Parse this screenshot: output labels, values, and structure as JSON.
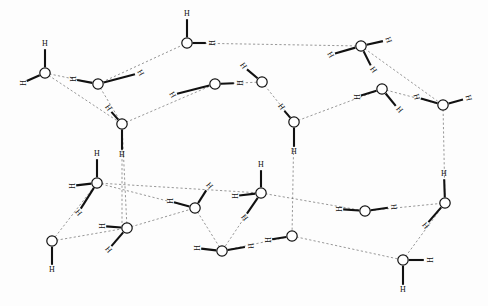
{
  "figure": {
    "title": "Hydrogen-bonded water lattice (ice structure)",
    "type": "molecular-structure-diagram",
    "background_color": "#ffffff",
    "oxygen_fill": "#ffffff",
    "oxygen_stroke": "#111111",
    "covalent_bond_color": "#111111",
    "hydrogen_bond_color": "#6b6b6b",
    "hydrogen_label": "H",
    "oxygen_radius": 5.2,
    "width": 488,
    "height": 306
  },
  "oxygens": [
    {
      "id": "o1",
      "name": "oxygen-upper-left",
      "x": 45,
      "y": 73
    },
    {
      "id": "o2",
      "name": "oxygen-upper-left-inner",
      "x": 98,
      "y": 84
    },
    {
      "id": "o3",
      "name": "oxygen-top-center",
      "x": 187,
      "y": 43
    },
    {
      "id": "o4",
      "name": "oxygen-mid-top-left",
      "x": 215,
      "y": 84
    },
    {
      "id": "o5",
      "name": "oxygen-mid-top-right",
      "x": 262,
      "y": 82
    },
    {
      "id": "o6",
      "name": "oxygen-top-right",
      "x": 361,
      "y": 46
    },
    {
      "id": "o7",
      "name": "oxygen-right-upper",
      "x": 382,
      "y": 89
    },
    {
      "id": "o8",
      "name": "oxygen-far-right-upper",
      "x": 443,
      "y": 105
    },
    {
      "id": "o9",
      "name": "oxygen-center-left-upper",
      "x": 122,
      "y": 124
    },
    {
      "id": "o10",
      "name": "oxygen-center-right-upper",
      "x": 294,
      "y": 122
    },
    {
      "id": "o11",
      "name": "oxygen-left-middle",
      "x": 97,
      "y": 183
    },
    {
      "id": "o12",
      "name": "oxygen-center-middle",
      "x": 261,
      "y": 193
    },
    {
      "id": "o13",
      "name": "oxygen-inner-lower-left",
      "x": 195,
      "y": 208
    },
    {
      "id": "o14",
      "name": "oxygen-right-middle",
      "x": 445,
      "y": 203
    },
    {
      "id": "o15",
      "name": "oxygen-lower-right-inner",
      "x": 365,
      "y": 211
    },
    {
      "id": "o16",
      "name": "oxygen-bottom-left",
      "x": 52,
      "y": 241
    },
    {
      "id": "o17",
      "name": "oxygen-bottom-left-inner",
      "x": 127,
      "y": 228
    },
    {
      "id": "o18",
      "name": "oxygen-bottom-center-left",
      "x": 222,
      "y": 251
    },
    {
      "id": "o19",
      "name": "oxygen-bottom-center-right",
      "x": 292,
      "y": 236
    },
    {
      "id": "o20",
      "name": "oxygen-bottom-right",
      "x": 403,
      "y": 260
    }
  ],
  "hydrogens": [
    {
      "id": "h1",
      "name": "hydrogen-o1-top",
      "x": 45,
      "y": 44,
      "rot": 0,
      "ox": 45,
      "oy": 73,
      "bond": "covalent"
    },
    {
      "id": "h2",
      "name": "hydrogen-o1-left",
      "x": 22,
      "y": 83,
      "rot": 90,
      "ox": 45,
      "oy": 73,
      "bond": "covalent"
    },
    {
      "id": "h3",
      "name": "hydrogen-o2-left",
      "x": 72,
      "y": 79,
      "rot": 90,
      "ox": 98,
      "oy": 84,
      "bond": "covalent"
    },
    {
      "id": "h4",
      "name": "hydrogen-o2-right",
      "x": 140,
      "y": 73,
      "rot": 60,
      "ox": 98,
      "oy": 84,
      "bond": "hydrogen"
    },
    {
      "id": "h5",
      "name": "hydrogen-o3-top",
      "x": 187,
      "y": 14,
      "rot": 0,
      "ox": 187,
      "oy": 43,
      "bond": "covalent"
    },
    {
      "id": "h6",
      "name": "hydrogen-o3-right",
      "x": 211,
      "y": 43,
      "rot": 90,
      "ox": 187,
      "oy": 43,
      "bond": "covalent"
    },
    {
      "id": "h7",
      "name": "hydrogen-o3-lower",
      "x": 243,
      "y": 66,
      "rot": 55,
      "ox": 262,
      "oy": 82,
      "bond": "covalent"
    },
    {
      "id": "h8",
      "name": "hydrogen-o4-o5",
      "x": 239,
      "y": 83,
      "rot": 90,
      "ox": 215,
      "oy": 84,
      "bond": "covalent"
    },
    {
      "id": "h9",
      "name": "hydrogen-o4-left",
      "x": 172,
      "y": 95,
      "rot": 60,
      "ox": 215,
      "oy": 84,
      "bond": "hydrogen"
    },
    {
      "id": "h10",
      "name": "hydrogen-o5-lower",
      "x": 281,
      "y": 107,
      "rot": 55,
      "ox": 294,
      "oy": 122,
      "bond": "covalent"
    },
    {
      "id": "h11",
      "name": "hydrogen-o6-right",
      "x": 388,
      "y": 40,
      "rot": 70,
      "ox": 361,
      "oy": 46,
      "bond": "covalent"
    },
    {
      "id": "h12",
      "name": "hydrogen-o6-left",
      "x": 330,
      "y": 55,
      "rot": 60,
      "ox": 361,
      "oy": 46,
      "bond": "hydrogen"
    },
    {
      "id": "h13",
      "name": "hydrogen-o6-lower",
      "x": 373,
      "y": 70,
      "rot": 55,
      "ox": 361,
      "oy": 46,
      "bond": "covalent"
    },
    {
      "id": "h14",
      "name": "hydrogen-o7-left",
      "x": 356,
      "y": 97,
      "rot": 90,
      "ox": 382,
      "oy": 89,
      "bond": "covalent"
    },
    {
      "id": "h15",
      "name": "hydrogen-o7-lower",
      "x": 399,
      "y": 110,
      "rot": 50,
      "ox": 382,
      "oy": 89,
      "bond": "covalent"
    },
    {
      "id": "h16",
      "name": "hydrogen-o8-right",
      "x": 468,
      "y": 98,
      "rot": 75,
      "ox": 443,
      "oy": 105,
      "bond": "covalent"
    },
    {
      "id": "h17",
      "name": "hydrogen-o8-left",
      "x": 416,
      "y": 97,
      "rot": 75,
      "ox": 443,
      "oy": 105,
      "bond": "covalent"
    },
    {
      "id": "h18",
      "name": "hydrogen-o9-lower",
      "x": 122,
      "y": 155,
      "rot": 0,
      "ox": 122,
      "oy": 124,
      "bond": "covalent"
    },
    {
      "id": "h19",
      "name": "hydrogen-o9-upper",
      "x": 108,
      "y": 108,
      "rot": 55,
      "ox": 122,
      "oy": 124,
      "bond": "covalent"
    },
    {
      "id": "h20",
      "name": "hydrogen-o10-lower",
      "x": 294,
      "y": 152,
      "rot": 0,
      "ox": 294,
      "oy": 122,
      "bond": "covalent"
    },
    {
      "id": "h21",
      "name": "hydrogen-o11-upper",
      "x": 97,
      "y": 154,
      "rot": 0,
      "ox": 97,
      "oy": 183,
      "bond": "covalent"
    },
    {
      "id": "h22",
      "name": "hydrogen-o11-left",
      "x": 71,
      "y": 186,
      "rot": 90,
      "ox": 97,
      "oy": 183,
      "bond": "covalent"
    },
    {
      "id": "h23",
      "name": "hydrogen-o11-lower",
      "x": 78,
      "y": 213,
      "rot": 50,
      "ox": 97,
      "oy": 183,
      "bond": "hydrogen"
    },
    {
      "id": "h24",
      "name": "hydrogen-o12-upper",
      "x": 261,
      "y": 165,
      "rot": 0,
      "ox": 261,
      "oy": 193,
      "bond": "covalent"
    },
    {
      "id": "h25",
      "name": "hydrogen-o12-left",
      "x": 234,
      "y": 196,
      "rot": 90,
      "ox": 261,
      "oy": 193,
      "bond": "covalent"
    },
    {
      "id": "h26",
      "name": "hydrogen-o12-lower",
      "x": 244,
      "y": 218,
      "rot": 50,
      "ox": 261,
      "oy": 193,
      "bond": "hydrogen"
    },
    {
      "id": "h27",
      "name": "hydrogen-o13-upper",
      "x": 209,
      "y": 186,
      "rot": 50,
      "ox": 195,
      "oy": 208,
      "bond": "covalent"
    },
    {
      "id": "h28",
      "name": "hydrogen-o13-left",
      "x": 169,
      "y": 201,
      "rot": 90,
      "ox": 195,
      "oy": 208,
      "bond": "covalent"
    },
    {
      "id": "h29",
      "name": "hydrogen-o14-upper",
      "x": 444,
      "y": 174,
      "rot": 0,
      "ox": 445,
      "oy": 203,
      "bond": "covalent"
    },
    {
      "id": "h30",
      "name": "hydrogen-o14-lower",
      "x": 425,
      "y": 226,
      "rot": 50,
      "ox": 445,
      "oy": 203,
      "bond": "covalent"
    },
    {
      "id": "h31",
      "name": "hydrogen-o15-left",
      "x": 338,
      "y": 209,
      "rot": 90,
      "ox": 365,
      "oy": 211,
      "bond": "covalent"
    },
    {
      "id": "h32",
      "name": "hydrogen-o15-right",
      "x": 393,
      "y": 207,
      "rot": 85,
      "ox": 365,
      "oy": 211,
      "bond": "covalent"
    },
    {
      "id": "h33",
      "name": "hydrogen-o16-lower",
      "x": 52,
      "y": 270,
      "rot": 0,
      "ox": 52,
      "oy": 241,
      "bond": "covalent"
    },
    {
      "id": "h34",
      "name": "hydrogen-o17-left",
      "x": 101,
      "y": 226,
      "rot": 90,
      "ox": 127,
      "oy": 228,
      "bond": "covalent"
    },
    {
      "id": "h35",
      "name": "hydrogen-o17-lower",
      "x": 108,
      "y": 250,
      "rot": 50,
      "ox": 127,
      "oy": 228,
      "bond": "covalent"
    },
    {
      "id": "h36",
      "name": "hydrogen-o18-left",
      "x": 196,
      "y": 248,
      "rot": 90,
      "ox": 222,
      "oy": 251,
      "bond": "covalent"
    },
    {
      "id": "h37",
      "name": "hydrogen-o18-right",
      "x": 250,
      "y": 246,
      "rot": 85,
      "ox": 222,
      "oy": 251,
      "bond": "covalent"
    },
    {
      "id": "h38",
      "name": "hydrogen-o19-left",
      "x": 267,
      "y": 240,
      "rot": 90,
      "ox": 292,
      "oy": 236,
      "bond": "covalent"
    },
    {
      "id": "h39",
      "name": "hydrogen-o20-right",
      "x": 429,
      "y": 260,
      "rot": 90,
      "ox": 403,
      "oy": 260,
      "bond": "covalent"
    },
    {
      "id": "h40",
      "name": "hydrogen-o20-lower",
      "x": 403,
      "y": 290,
      "rot": 0,
      "ox": 403,
      "oy": 260,
      "bond": "covalent"
    }
  ],
  "hydrogen_bonds": [
    {
      "name": "hbond-o1-o2",
      "x1": 45,
      "y1": 73,
      "x2": 98,
      "y2": 84
    },
    {
      "name": "hbond-o2-o3",
      "x1": 98,
      "y1": 84,
      "x2": 187,
      "y2": 43
    },
    {
      "name": "hbond-o3-o6",
      "x1": 187,
      "y1": 43,
      "x2": 361,
      "y2": 46
    },
    {
      "name": "hbond-o1-o9",
      "x1": 45,
      "y1": 73,
      "x2": 122,
      "y2": 124
    },
    {
      "name": "hbond-o2-o9",
      "x1": 98,
      "y1": 84,
      "x2": 122,
      "y2": 124
    },
    {
      "name": "hbond-o9-o4",
      "x1": 122,
      "y1": 124,
      "x2": 215,
      "y2": 84
    },
    {
      "name": "hbond-o4-o5",
      "x1": 215,
      "y1": 84,
      "x2": 262,
      "y2": 82
    },
    {
      "name": "hbond-o5-o10",
      "x1": 262,
      "y1": 82,
      "x2": 294,
      "y2": 122
    },
    {
      "name": "hbond-o10-o7",
      "x1": 294,
      "y1": 122,
      "x2": 382,
      "y2": 89
    },
    {
      "name": "hbond-o7-o8",
      "x1": 382,
      "y1": 89,
      "x2": 443,
      "y2": 105
    },
    {
      "name": "hbond-o6-o8",
      "x1": 361,
      "y1": 46,
      "x2": 443,
      "y2": 105
    },
    {
      "name": "hbond-o9-stem",
      "x1": 122,
      "y1": 124,
      "x2": 122,
      "y2": 228
    },
    {
      "name": "hbond-o10-stem",
      "x1": 294,
      "y1": 122,
      "x2": 292,
      "y2": 236
    },
    {
      "name": "hbond-o8-stem",
      "x1": 443,
      "y1": 105,
      "x2": 445,
      "y2": 203
    },
    {
      "name": "hbond-o11-o12",
      "x1": 97,
      "y1": 183,
      "x2": 261,
      "y2": 193
    },
    {
      "name": "hbond-o12-o15",
      "x1": 261,
      "y1": 193,
      "x2": 365,
      "y2": 211
    },
    {
      "name": "hbond-o15-o14",
      "x1": 365,
      "y1": 211,
      "x2": 445,
      "y2": 203
    },
    {
      "name": "hbond-o11-o16",
      "x1": 97,
      "y1": 183,
      "x2": 52,
      "y2": 241
    },
    {
      "name": "hbond-o16-o17",
      "x1": 52,
      "y1": 241,
      "x2": 127,
      "y2": 228
    },
    {
      "name": "hbond-o17-o13",
      "x1": 127,
      "y1": 228,
      "x2": 195,
      "y2": 208
    },
    {
      "name": "hbond-o13-o18",
      "x1": 195,
      "y1": 208,
      "x2": 222,
      "y2": 251
    },
    {
      "name": "hbond-o18-o19",
      "x1": 222,
      "y1": 251,
      "x2": 292,
      "y2": 236
    },
    {
      "name": "hbond-o12-o18",
      "x1": 261,
      "y1": 193,
      "x2": 222,
      "y2": 251
    },
    {
      "name": "hbond-o19-o20",
      "x1": 292,
      "y1": 236,
      "x2": 403,
      "y2": 260
    },
    {
      "name": "hbond-o20-o14",
      "x1": 403,
      "y1": 260,
      "x2": 445,
      "y2": 203
    },
    {
      "name": "hbond-o11-o13",
      "x1": 97,
      "y1": 183,
      "x2": 195,
      "y2": 208
    },
    {
      "name": "hbond-o17-stem",
      "x1": 127,
      "y1": 228,
      "x2": 122,
      "y2": 124
    }
  ]
}
